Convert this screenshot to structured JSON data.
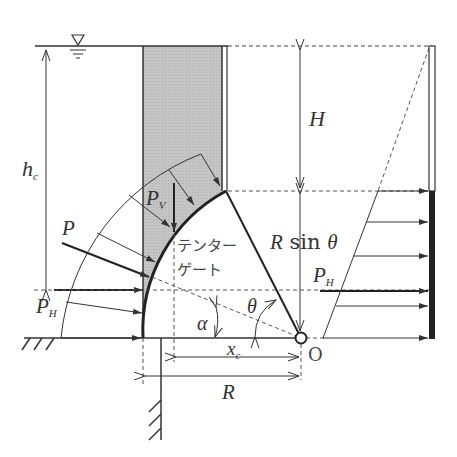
{
  "figure": {
    "colors": {
      "line": "#333333",
      "shade": "#c8c8c8",
      "background": "#ffffff"
    }
  },
  "labels": {
    "hc": {
      "main": "h",
      "sub": "c"
    },
    "H": "H",
    "R_sin_theta": {
      "R": "R",
      "sin": "sin",
      "theta": "θ"
    },
    "Pv": {
      "main": "P",
      "sub": "V"
    },
    "P": "P",
    "PH_left": {
      "main": "P",
      "sub": "H"
    },
    "PH_right": {
      "main": "P",
      "sub": "H"
    },
    "gate_line1": "テンター",
    "gate_line2": "ゲート",
    "alpha": "α",
    "theta": "θ",
    "xc": {
      "main": "x",
      "sub": "c"
    },
    "R": "R",
    "O": "O"
  },
  "symbols": {
    "water_surface": "water-level-triangle"
  }
}
